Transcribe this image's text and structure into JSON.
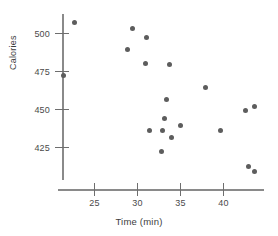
{
  "chart_data": {
    "type": "scatter",
    "title": "",
    "xlabel": "Time (min)",
    "ylabel": "Calories",
    "xlim": [
      21.0,
      45.0
    ],
    "ylim": [
      408,
      512
    ],
    "grid": false,
    "legend": null,
    "xticks": [
      25,
      30,
      35,
      40
    ],
    "yticks": [
      425,
      450,
      475,
      500
    ],
    "xtick_labels": [
      "25",
      "30",
      "35",
      "40"
    ],
    "ytick_labels": [
      "425",
      "450",
      "475",
      "500"
    ],
    "marker": {
      "shape": "circle",
      "color": "#5d5d5d",
      "size_px": 5
    },
    "axis_color": "#8a8a8a",
    "text_color": "#3d3d3d",
    "background": "#ffffff",
    "points": [
      {
        "x": 22.7,
        "y": 507
      },
      {
        "x": 21.4,
        "y": 472
      },
      {
        "x": 29.5,
        "y": 503
      },
      {
        "x": 31.1,
        "y": 497
      },
      {
        "x": 28.9,
        "y": 489
      },
      {
        "x": 31.0,
        "y": 480
      },
      {
        "x": 33.8,
        "y": 479
      },
      {
        "x": 38.0,
        "y": 464
      },
      {
        "x": 33.4,
        "y": 456
      },
      {
        "x": 43.7,
        "y": 452
      },
      {
        "x": 42.6,
        "y": 449
      },
      {
        "x": 33.2,
        "y": 444
      },
      {
        "x": 35.0,
        "y": 439
      },
      {
        "x": 31.4,
        "y": 436
      },
      {
        "x": 33.0,
        "y": 436
      },
      {
        "x": 39.7,
        "y": 436
      },
      {
        "x": 34.0,
        "y": 431
      },
      {
        "x": 32.9,
        "y": 422
      },
      {
        "x": 43.0,
        "y": 412
      },
      {
        "x": 43.6,
        "y": 409
      }
    ]
  }
}
